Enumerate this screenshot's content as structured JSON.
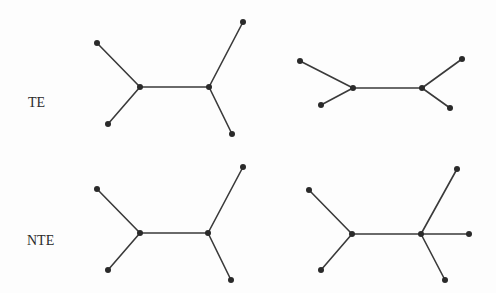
{
  "labels": {
    "row1": "TE",
    "row2": "NTE"
  },
  "style": {
    "edge_color": "#3a3a3a",
    "node_color": "#2a2a2a",
    "background": "#fdfdfd"
  },
  "trees": [
    {
      "id": "te-left",
      "row": "TE",
      "nodes": [
        [
          97,
          43
        ],
        [
          140,
          87
        ],
        [
          209,
          87
        ],
        [
          243,
          22
        ],
        [
          108,
          124
        ],
        [
          232,
          134
        ]
      ],
      "edges": [
        [
          0,
          1
        ],
        [
          4,
          1
        ],
        [
          1,
          2
        ],
        [
          2,
          3
        ],
        [
          2,
          5
        ]
      ]
    },
    {
      "id": "te-right",
      "row": "TE",
      "nodes": [
        [
          300,
          61
        ],
        [
          353,
          88
        ],
        [
          422,
          88
        ],
        [
          462,
          59
        ],
        [
          321,
          105
        ],
        [
          450,
          108
        ]
      ],
      "edges": [
        [
          0,
          1
        ],
        [
          4,
          1
        ],
        [
          1,
          2
        ],
        [
          2,
          3
        ],
        [
          2,
          5
        ]
      ]
    },
    {
      "id": "nte-left",
      "row": "NTE",
      "nodes": [
        [
          97,
          189
        ],
        [
          140,
          233
        ],
        [
          208,
          233
        ],
        [
          243,
          167
        ],
        [
          108,
          270
        ],
        [
          231,
          280
        ]
      ],
      "edges": [
        [
          0,
          1
        ],
        [
          4,
          1
        ],
        [
          1,
          2
        ],
        [
          2,
          3
        ],
        [
          2,
          5
        ]
      ]
    },
    {
      "id": "nte-right",
      "row": "NTE",
      "nodes": [
        [
          309,
          190
        ],
        [
          352,
          234
        ],
        [
          421,
          234
        ],
        [
          457,
          169
        ],
        [
          469,
          234
        ],
        [
          321,
          270
        ],
        [
          445,
          280
        ]
      ],
      "edges": [
        [
          0,
          1
        ],
        [
          5,
          1
        ],
        [
          1,
          2
        ],
        [
          2,
          3
        ],
        [
          2,
          4
        ],
        [
          2,
          6
        ]
      ]
    }
  ]
}
